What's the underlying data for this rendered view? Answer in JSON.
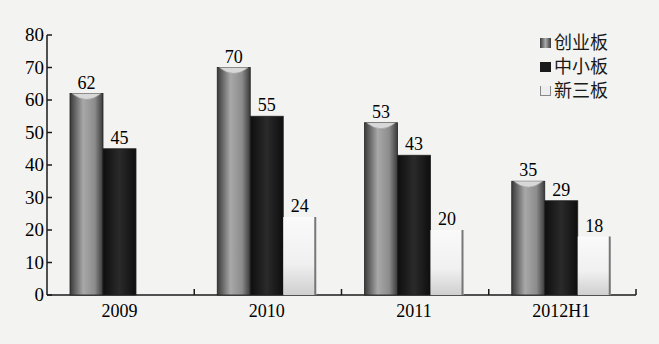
{
  "chart_data": {
    "type": "bar",
    "title": "",
    "xlabel": "",
    "ylabel": "",
    "categories": [
      "2009",
      "2010",
      "2011",
      "2012H1"
    ],
    "series": [
      {
        "name": "创业板",
        "values": [
          62,
          70,
          53,
          35
        ],
        "color": "#8a8a8a"
      },
      {
        "name": "中小板",
        "values": [
          45,
          55,
          43,
          29
        ],
        "color": "#1e1e1e"
      },
      {
        "name": "新三板",
        "values": [
          null,
          24,
          20,
          18
        ],
        "color": "#e2e2e2"
      }
    ],
    "ylim": [
      0,
      80
    ],
    "yticks": [
      0,
      10,
      20,
      30,
      40,
      50,
      60,
      70,
      80
    ],
    "grid": false,
    "legend_position": "top-right",
    "data_labels": true
  },
  "legend": {
    "items": [
      {
        "label": "创业板"
      },
      {
        "label": "中小板"
      },
      {
        "label": "新三板"
      }
    ]
  }
}
